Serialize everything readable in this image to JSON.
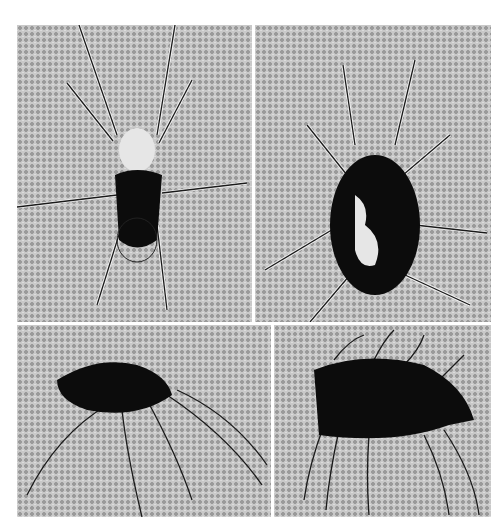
{
  "figure": {
    "panels": [
      {
        "id": "top-left",
        "subject": "mite, ventral/dorsal view with long legs"
      },
      {
        "id": "top-right",
        "subject": "mite, dorsal view, dark oval body"
      },
      {
        "id": "bottom-left",
        "subject": "mite, lateral view, long curved legs"
      },
      {
        "id": "bottom-right",
        "subject": "mite, lateral view, hairy dark body"
      }
    ],
    "colors": {
      "paper": "#ffffff",
      "halftone_background": "#c9c9c9",
      "ink": "#0c0c0c"
    }
  }
}
